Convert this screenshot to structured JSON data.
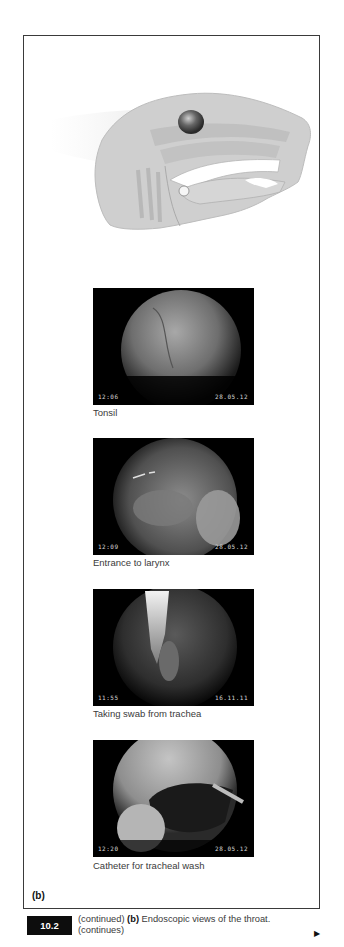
{
  "figure": {
    "panel_label": "(b)",
    "number": "10.2",
    "caption_prefix": "(continued)",
    "caption_bold": "(b)",
    "caption_text": "Endoscopic views of the throat.",
    "caption_suffix": "(continues)",
    "next_icon": "right-triangle-arrow"
  },
  "illustration": {
    "subject": "Sagittal section of head showing throat anatomy",
    "highlight_marker": "circle marking tonsil region"
  },
  "photos": [
    {
      "caption": "Tonsil",
      "time": "12:06",
      "date": "28.05.12"
    },
    {
      "caption": "Entrance to larynx",
      "time": "12:09",
      "date": "28.05.12"
    },
    {
      "caption": "Taking swab from trachea",
      "time": "11:55",
      "date": "16.11.11"
    },
    {
      "caption": "Catheter for tracheal wash",
      "time": "12:20",
      "date": "28.05.12"
    }
  ]
}
